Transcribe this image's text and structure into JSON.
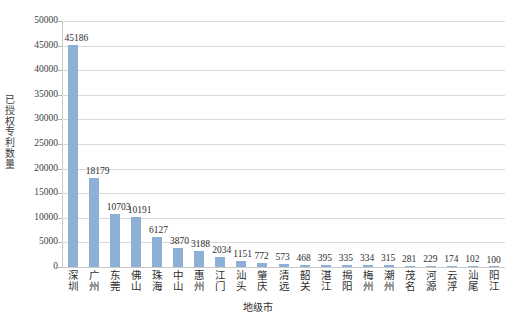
{
  "chart_data": {
    "type": "bar",
    "title": "",
    "xlabel": "地级市",
    "ylabel": "已授权专利数量",
    "ylim": [
      0,
      50000
    ],
    "ytick_interval": 5000,
    "yticks": [
      "50000",
      "45000",
      "40000",
      "35000",
      "30000",
      "25000",
      "20000",
      "15000",
      "10000",
      "5000",
      "0"
    ],
    "grid": true,
    "legend": "none",
    "bar_color": "#8cb0d6",
    "categories": [
      "深圳",
      "广州",
      "东莞",
      "佛山",
      "珠海",
      "中山",
      "惠州",
      "江门",
      "汕头",
      "肇庆",
      "清远",
      "韶关",
      "湛江",
      "揭阳",
      "梅州",
      "潮州",
      "茂名",
      "河源",
      "云浮",
      "汕尾",
      "阳江"
    ],
    "values": [
      45186,
      18179,
      10703,
      10191,
      6127,
      3870,
      3188,
      2034,
      1151,
      772,
      573,
      468,
      395,
      335,
      334,
      315,
      281,
      229,
      174,
      102,
      100
    ],
    "data_labels": [
      "45186",
      "18179",
      "10703",
      "10191",
      "6127",
      "3870",
      "3188",
      "2034",
      "1151",
      "772",
      "573",
      "468",
      "395",
      "335",
      "334",
      "315",
      "281",
      "229",
      "174",
      "102",
      "100"
    ]
  }
}
